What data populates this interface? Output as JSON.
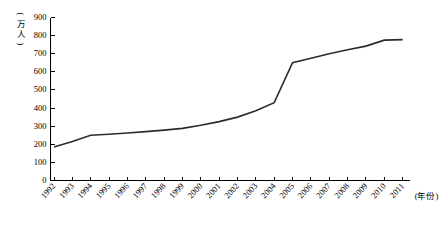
{
  "chart_data": {
    "type": "line",
    "title": "",
    "xlabel": "(年份)",
    "ylabel": "(万人)",
    "ylim": [
      0,
      900
    ],
    "ytick_values": [
      0,
      100,
      200,
      300,
      400,
      500,
      600,
      700,
      800,
      900
    ],
    "ytick_labels": [
      "0",
      "100",
      "200",
      "300",
      "400",
      "500",
      "600",
      "700",
      "800",
      "900"
    ],
    "grid": false,
    "legend": "none",
    "categories": [
      "1992",
      "1993",
      "1994",
      "1995",
      "1996",
      "1997",
      "1998",
      "1999",
      "2000",
      "2001",
      "2002",
      "2003",
      "2004",
      "2005",
      "2006",
      "2007",
      "2008",
      "2009",
      "2010",
      "2011"
    ],
    "series": [
      {
        "name": "人数",
        "values": [
          185,
          215,
          250,
          255,
          262,
          270,
          278,
          288,
          305,
          325,
          350,
          385,
          430,
          650,
          675,
          700,
          722,
          742,
          775,
          778
        ]
      }
    ]
  },
  "axes": {
    "y_unit_chars": [
      "(",
      "万",
      "人",
      ")"
    ],
    "x_unit": "(年份)"
  }
}
